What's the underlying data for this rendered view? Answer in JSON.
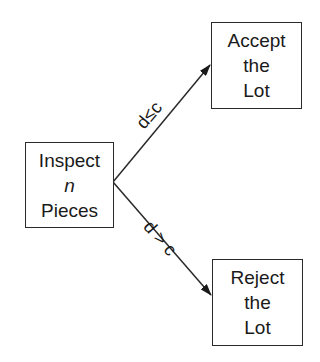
{
  "nodes": {
    "inspect": {
      "line1": "Inspect",
      "line2": "n",
      "line3": "Pieces"
    },
    "accept": {
      "line1": "Accept",
      "line2": "the",
      "line3": "Lot"
    },
    "reject": {
      "line1": "Reject",
      "line2": "the",
      "line3": "Lot"
    }
  },
  "edges": {
    "to_accept": {
      "label": "d≤c",
      "from": "inspect",
      "to": "accept"
    },
    "to_reject": {
      "label": "d > c",
      "from": "inspect",
      "to": "reject"
    }
  },
  "colors": {
    "stroke": "#2a2a2a",
    "background": "#ffffff"
  }
}
